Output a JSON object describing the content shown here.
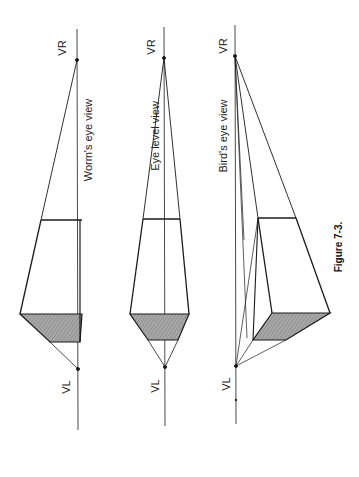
{
  "figure": {
    "caption": "Figure 7-3.",
    "orientation": "rotated 90° counter-clockwise",
    "panels": [
      {
        "title": "Worm's eye view",
        "vanishing_right": "VR",
        "vanishing_left": "VL"
      },
      {
        "title": "Eye level view",
        "vanishing_right": "VR",
        "vanishing_left": "VL"
      },
      {
        "title": "Bird's eye view",
        "vanishing_right": "VR",
        "vanishing_left": "VL"
      }
    ]
  },
  "colors": {
    "line": "#1a1a1a",
    "shade": "#9a9a9a",
    "background": "#ffffff"
  }
}
